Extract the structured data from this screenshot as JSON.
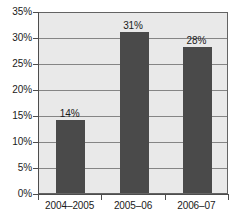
{
  "chart_data": {
    "type": "bar",
    "title": "",
    "subtitle": "",
    "xlabel": "",
    "ylabel": "",
    "categories": [
      "2004–2005",
      "2005–06",
      "2006–07"
    ],
    "values": [
      14,
      31,
      28
    ],
    "value_labels": [
      "14%",
      "31%",
      "28%"
    ],
    "ylim": [
      0,
      35
    ],
    "ytick_values": [
      0,
      5,
      10,
      15,
      20,
      25,
      30,
      35
    ],
    "ytick_labels": [
      "0%",
      "5%",
      "10%",
      "15%",
      "20%",
      "25%",
      "30%",
      "35%"
    ],
    "grid": true,
    "grid_axis": "y",
    "legend": false,
    "legend_position": "none",
    "annotations": [],
    "colors": {
      "bar": "#4a4a4a",
      "plot_background": "#e9e9e9",
      "plot_border": "#636363",
      "gridline": "#858585",
      "axis_line": "#4d4d4d",
      "text": "#1a1a1a",
      "page_background": "#ffffff"
    }
  }
}
